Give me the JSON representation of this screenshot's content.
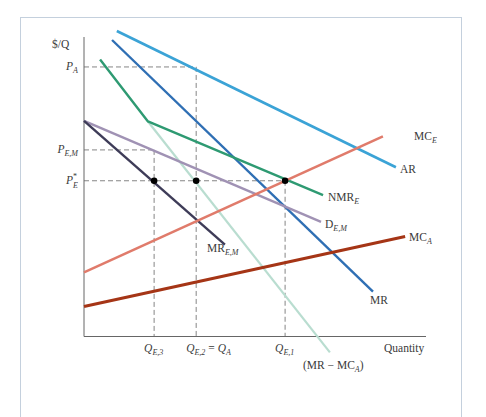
{
  "chart_data": {
    "type": "line",
    "title": "",
    "xlabel": "Quantity",
    "ylabel": "$/Q",
    "axis_range": {
      "x": [
        0,
        100
      ],
      "y": [
        0,
        100
      ]
    },
    "grid": false,
    "y_ticks": [
      {
        "id": "PA",
        "main": "P",
        "sub": "A",
        "star": "",
        "y": 90
      },
      {
        "id": "PEM",
        "main": "P",
        "sub": "E,M",
        "star": "",
        "y": 62.3
      },
      {
        "id": "PE",
        "main": "P",
        "sub": "E",
        "star": "*",
        "y": 52
      }
    ],
    "x_ticks": [
      {
        "id": "QE3",
        "main": "Q",
        "sub": "E,3",
        "rest": "",
        "rest_sub": "",
        "x": 20.5
      },
      {
        "id": "QE2",
        "main": "Q",
        "sub": "E,2",
        "rest": " = Q",
        "rest_sub": "A",
        "x": 32.8
      },
      {
        "id": "QE1",
        "main": "Q",
        "sub": "E,1",
        "rest": "",
        "rest_sub": "",
        "x": 58.8
      }
    ],
    "series": [
      {
        "id": "AR",
        "name": "AR",
        "label_main": "AR",
        "label_sub": "",
        "color": "#3ba3d6",
        "points": [
          [
            9.6,
            102
          ],
          [
            91.2,
            56.5
          ]
        ]
      },
      {
        "id": "MR",
        "name": "MR",
        "label_main": "MR",
        "label_sub": "",
        "color": "#2f6fb4",
        "points": [
          [
            8.2,
            99
          ],
          [
            84.5,
            15
          ]
        ]
      },
      {
        "id": "NMRE",
        "name": "NMR_E",
        "label_main": "NMR",
        "label_sub": "E",
        "color": "#2e9a72",
        "points": [
          [
            4.7,
            92.5
          ],
          [
            18.7,
            71.8
          ],
          [
            69.9,
            47.2
          ]
        ]
      },
      {
        "id": "MRminusMCA",
        "name": "(MR − MC_A)",
        "label_main": "(MR − MC",
        "label_sub": "A",
        "label_tail": ")",
        "color": "#b9ddd0",
        "points": [
          [
            18.7,
            71.8
          ],
          [
            71.9,
            -5.3
          ]
        ]
      },
      {
        "id": "DEM",
        "name": "D_E,M",
        "label_main": "D",
        "label_sub": "E,M",
        "color": "#a092b4",
        "points": [
          [
            0,
            72
          ],
          [
            69.3,
            38.3
          ]
        ]
      },
      {
        "id": "MREM",
        "name": "MR_E,M",
        "label_main": "MR",
        "label_sub": "E,M",
        "color": "#3e3c58",
        "points": [
          [
            0,
            72
          ],
          [
            41.2,
            30.7
          ]
        ]
      },
      {
        "id": "MCE",
        "name": "MC_E",
        "label_main": "MC",
        "label_sub": "E",
        "color": "#e07b6b",
        "points": [
          [
            0,
            21.4
          ],
          [
            87.4,
            66.8
          ]
        ]
      },
      {
        "id": "MCA",
        "name": "MC_A",
        "label_main": "MC",
        "label_sub": "A",
        "color": "#a53516",
        "points": [
          [
            0,
            10
          ],
          [
            93.9,
            33.4
          ]
        ]
      }
    ],
    "points": [
      {
        "id": "dot-QE3",
        "x": 20.5,
        "y": 52
      },
      {
        "id": "dot-QE2",
        "x": 32.8,
        "y": 52
      },
      {
        "id": "dot-QE1",
        "x": 58.8,
        "y": 52
      }
    ],
    "guides": [
      {
        "id": "guide-PA-h",
        "from": [
          0,
          90
        ],
        "to": [
          32.8,
          90
        ]
      },
      {
        "id": "guide-PEM-h",
        "from": [
          0,
          62.3
        ],
        "to": [
          20.5,
          62.3
        ]
      },
      {
        "id": "guide-PE-h",
        "from": [
          0,
          52
        ],
        "to": [
          58.8,
          52
        ]
      },
      {
        "id": "guide-QE3-v",
        "from": [
          20.5,
          62.3
        ],
        "to": [
          20.5,
          0
        ]
      },
      {
        "id": "guide-QE2-v",
        "from": [
          32.8,
          90
        ],
        "to": [
          32.8,
          0
        ]
      },
      {
        "id": "guide-QE1-v",
        "from": [
          58.8,
          52
        ],
        "to": [
          58.8,
          0
        ]
      }
    ]
  }
}
